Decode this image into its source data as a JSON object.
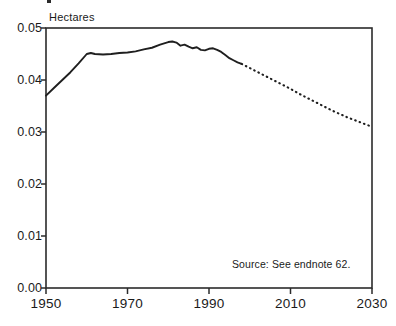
{
  "chart_data": {
    "type": "line",
    "title": "",
    "xlabel": "",
    "ylabel": "Hectares",
    "unit_label": "Hectares",
    "xlim": [
      1950,
      2030
    ],
    "ylim": [
      0.0,
      0.05
    ],
    "xticks": [
      1950,
      1970,
      1990,
      2010,
      2030
    ],
    "xtick_labels": [
      "1950",
      "1970",
      "1990",
      "2010",
      "2030"
    ],
    "yticks": [
      0.0,
      0.01,
      0.02,
      0.03,
      0.04,
      0.05
    ],
    "ytick_labels": [
      "0.00",
      "0.01",
      "0.02",
      "0.03",
      "0.04",
      "0.05"
    ],
    "grid": false,
    "legend": null,
    "annotations": [
      {
        "text": "Source: See endnote 62.",
        "x": 2012,
        "y": 0.0058
      }
    ],
    "series": [
      {
        "name": "Grainland Area Per Person (historical)",
        "style": "solid",
        "x": [
          1950,
          1952,
          1954,
          1956,
          1958,
          1960,
          1961,
          1962,
          1964,
          1966,
          1968,
          1970,
          1972,
          1974,
          1976,
          1978,
          1980,
          1981,
          1982,
          1983,
          1984,
          1985,
          1986,
          1987,
          1988,
          1989,
          1990,
          1991,
          1992,
          1993,
          1994,
          1995,
          1996,
          1997,
          1998
        ],
        "y": [
          0.037,
          0.0385,
          0.04,
          0.0415,
          0.0432,
          0.045,
          0.0452,
          0.045,
          0.0449,
          0.045,
          0.0452,
          0.0453,
          0.0455,
          0.0459,
          0.0462,
          0.0468,
          0.0473,
          0.0474,
          0.0472,
          0.0466,
          0.0468,
          0.0464,
          0.0461,
          0.0463,
          0.0458,
          0.0457,
          0.046,
          0.0461,
          0.0458,
          0.0454,
          0.0448,
          0.0442,
          0.0438,
          0.0434,
          0.0431
        ]
      },
      {
        "name": "Grainland Area Per Person (projected)",
        "style": "dotted",
        "x": [
          1998,
          2000,
          2002,
          2004,
          2006,
          2008,
          2010,
          2012,
          2014,
          2016,
          2018,
          2020,
          2022,
          2024,
          2026,
          2028,
          2030
        ],
        "y": [
          0.0431,
          0.0423,
          0.0415,
          0.0407,
          0.0399,
          0.0391,
          0.0383,
          0.0374,
          0.0366,
          0.0358,
          0.035,
          0.0342,
          0.0335,
          0.0328,
          0.0322,
          0.0316,
          0.031
        ]
      }
    ]
  },
  "colors": {
    "ink": "#1a1a1a",
    "axis": "#2b2b2b",
    "line": "#1f1f1f",
    "background": "#ffffff"
  }
}
